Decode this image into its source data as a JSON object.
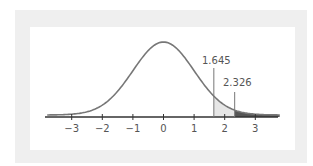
{
  "chart_data": {
    "type": "area",
    "title": "",
    "subtitle": "Standard normal distribution with right-tail critical values",
    "xlabel": "",
    "ylabel": "",
    "x_ticks": [
      -3,
      -2,
      -1,
      0,
      1,
      2,
      3
    ],
    "x_tick_labels": [
      "−3",
      "−2",
      "−1",
      "0",
      "1",
      "2",
      "3"
    ],
    "xlim": [
      -3.8,
      3.8
    ],
    "grid": false,
    "legend": null,
    "curve": "standard normal pdf, mean 0, sd 1",
    "annotations": [
      {
        "label": "1.645",
        "x": 1.645,
        "shade_to": 2.326,
        "shade_color": "#e6e6e6"
      },
      {
        "label": "2.326",
        "x": 2.326,
        "shade_to": "inf",
        "shade_color": "#555555"
      }
    ]
  },
  "colors": {
    "curve": "#777777",
    "axis": "#333333",
    "frame": "#efefef",
    "panel": "#ffffff",
    "light_shade": "#e6e6e6",
    "dark_shade": "#555555"
  },
  "labels": {
    "crit1": "1.645",
    "crit2": "2.326",
    "ticks": [
      "−3",
      "−2",
      "−1",
      "0",
      "1",
      "2",
      "3"
    ]
  }
}
